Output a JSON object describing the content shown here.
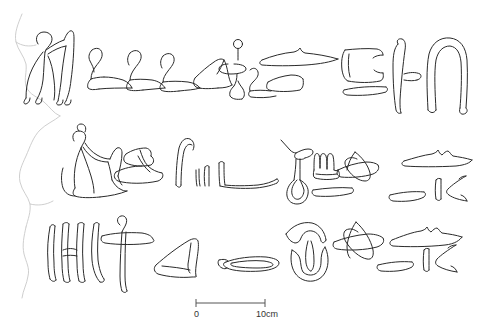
{
  "figure": {
    "kind": "archaeological-line-drawing",
    "background_color": "#ffffff",
    "ink_color": "#2a2a2a",
    "break_edge_color": "#c8c8c8"
  },
  "scale_bar": {
    "start_label": "0",
    "end_label": "10cm",
    "bar_start_x": 196,
    "bar_end_x": 265,
    "bar_y": 303,
    "unit": "cm",
    "length_value": 10
  },
  "rows": [
    {
      "index": 1,
      "label": "register-1",
      "glyphs": [
        {
          "id": "r1-g1",
          "name": "standing-man-with-raised-arms"
        },
        {
          "id": "r1-g2",
          "name": "seated-leg-sign-a"
        },
        {
          "id": "r1-g3",
          "name": "seated-leg-sign-b"
        },
        {
          "id": "r1-g4",
          "name": "seated-leg-sign-c"
        },
        {
          "id": "r1-g5",
          "name": "circle-on-pole-and-oval"
        },
        {
          "id": "r1-g6",
          "name": "crouching-figure-small"
        },
        {
          "id": "r1-g7",
          "name": "horizontal-bar-with-notch"
        },
        {
          "id": "r1-g8",
          "name": "low-angled-stroke"
        },
        {
          "id": "r1-g9",
          "name": "open-box-c-shape"
        },
        {
          "id": "r1-g10",
          "name": "horizontal-flat-bar"
        },
        {
          "id": "r1-g11",
          "name": "vertical-with-side-hook"
        },
        {
          "id": "r1-g12",
          "name": "inverted-u-arch"
        }
      ]
    },
    {
      "index": 2,
      "label": "register-2",
      "glyphs": [
        {
          "id": "r2-g1",
          "name": "kneeling-human-figure"
        },
        {
          "id": "r2-g2",
          "name": "forked-stroke-sign"
        },
        {
          "id": "r2-g3",
          "name": "hooked-staff"
        },
        {
          "id": "r2-g4",
          "name": "short-paired-strokes"
        },
        {
          "id": "r2-g5",
          "name": "reversed-l-base-line"
        },
        {
          "id": "r2-g6",
          "name": "branching-stem-sign"
        },
        {
          "id": "r2-g7",
          "name": "looped-sandal-strap"
        },
        {
          "id": "r2-g8",
          "name": "crenellated-three-peak-sign"
        },
        {
          "id": "r2-g9",
          "name": "pointed-leaf-fish-sign"
        },
        {
          "id": "r2-g10",
          "name": "short-horizontal-bar"
        },
        {
          "id": "r2-g11",
          "name": "feather-horizontal-sign"
        },
        {
          "id": "r2-g12",
          "name": "thin-horizontal-dash"
        },
        {
          "id": "r2-g13",
          "name": "vertical-tick-and-chevron"
        }
      ]
    },
    {
      "index": 3,
      "label": "register-3",
      "glyphs": [
        {
          "id": "r3-g1",
          "name": "vertical-stroke-group"
        },
        {
          "id": "r3-g2",
          "name": "ankh-like-cross-sign"
        },
        {
          "id": "r3-g3",
          "name": "angular-arrow-sign"
        },
        {
          "id": "r3-g4",
          "name": "elongated-oval-mouth-sign"
        },
        {
          "id": "r3-g5",
          "name": "crescent-over-bowl-sign"
        },
        {
          "id": "r3-g6",
          "name": "pointed-leaf-fish-sign-2"
        },
        {
          "id": "r3-g7",
          "name": "feather-horizontal-sign-2"
        },
        {
          "id": "r3-g8",
          "name": "thin-horizontal-dash-2"
        },
        {
          "id": "r3-g9",
          "name": "vertical-tick-and-chevron-2"
        }
      ]
    }
  ]
}
